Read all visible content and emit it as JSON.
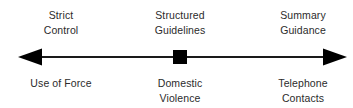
{
  "figure": {
    "type": "continuum-diagram",
    "background_color": "#ffffff",
    "ink_color": "#000000",
    "text_color": "#2b2b2b",
    "width": 353,
    "height": 108
  },
  "axis": {
    "name": "discretion-continuum",
    "orientation": "horizontal",
    "style": "double-headed-arrow",
    "line_color": "#1a1a1a",
    "line_thickness_px": 2,
    "start_x": 18,
    "end_x": 347,
    "y": 57,
    "left_arrowhead": {
      "name": "left-arrowhead",
      "width": 24,
      "height": 17
    },
    "right_arrowhead": {
      "name": "right-arrowhead",
      "width": 24,
      "height": 17
    },
    "center_marker": {
      "name": "center-square-marker",
      "shape": "square",
      "size": 14,
      "x": 180
    }
  },
  "points": [
    {
      "id": "left",
      "x": 61,
      "top_label_lines": [
        "Strict",
        "Control"
      ],
      "bottom_label_lines": [
        "Use of Force"
      ]
    },
    {
      "id": "center",
      "x": 180,
      "top_label_lines": [
        "Structured",
        "Guidelines"
      ],
      "bottom_label_lines": [
        "Domestic",
        "Violence"
      ]
    },
    {
      "id": "right",
      "x": 303,
      "top_label_lines": [
        "Summary",
        "Guidance"
      ],
      "bottom_label_lines": [
        "Telephone",
        "Contacts"
      ]
    }
  ],
  "labels": {
    "left_top_line1": "Strict",
    "left_top_line2": "Control",
    "center_top_line1": "Structured",
    "center_top_line2": "Guidelines",
    "right_top_line1": "Summary",
    "right_top_line2": "Guidance",
    "left_bottom_line1": "Use of Force",
    "center_bottom_line1": "Domestic",
    "center_bottom_line2": "Violence",
    "right_bottom_line1": "Telephone",
    "right_bottom_line2": "Contacts"
  }
}
